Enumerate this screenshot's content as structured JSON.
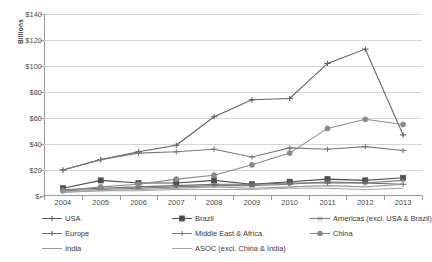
{
  "chart_data": {
    "type": "line",
    "title": "",
    "xlabel": "",
    "ylabel": "Billions",
    "y_axis_title": "Billions",
    "categories": [
      "2004",
      "2005",
      "2006",
      "2007",
      "2008",
      "2009",
      "2010",
      "2011",
      "2012",
      "2013"
    ],
    "x": [
      2004,
      2005,
      2006,
      2007,
      2008,
      2009,
      2010,
      2011,
      2012,
      2013
    ],
    "ylim": [
      0,
      140
    ],
    "ytick_labels": [
      "$-",
      "$20",
      "$40",
      "$60",
      "$80",
      "$100",
      "$120",
      "$140"
    ],
    "ytick_values": [
      0,
      20,
      40,
      60,
      80,
      100,
      120,
      140
    ],
    "grid": true,
    "legend_position": "bottom",
    "series": [
      {
        "name": "USA",
        "marker": "cross",
        "color": "#5f5f5f",
        "values": [
          20,
          28,
          34,
          39,
          61,
          74,
          75,
          102,
          113,
          47
        ]
      },
      {
        "name": "Brazil",
        "marker": "square",
        "color": "#4d4d4d",
        "values": [
          6,
          12,
          10,
          10,
          12,
          9,
          11,
          13,
          12,
          14
        ]
      },
      {
        "name": "Americas (excl. USA & Brazil)",
        "marker": "asterisk",
        "color": "#7a7a7a",
        "values": [
          4,
          5,
          6,
          7,
          8,
          8,
          9,
          11,
          10,
          12
        ]
      },
      {
        "name": "Europe",
        "marker": "plus",
        "color": "#6b6b6b",
        "values": [
          5,
          6,
          7,
          8,
          9,
          9,
          10,
          10,
          10,
          9
        ]
      },
      {
        "name": "Middle East & Africa",
        "marker": "plus",
        "color": "#7a7a7a",
        "values": [
          20,
          28,
          33,
          34,
          36,
          30,
          37,
          36,
          38,
          35
        ]
      },
      {
        "name": "China",
        "marker": "circle",
        "color": "#8a8a8a",
        "values": [
          4,
          7,
          9,
          13,
          16,
          24,
          33,
          52,
          59,
          55
        ]
      },
      {
        "name": "India",
        "marker": "none",
        "color": "#9a9a9a",
        "values": [
          3,
          4,
          5,
          6,
          7,
          6,
          7,
          8,
          7,
          9
        ]
      },
      {
        "name": "ASOC (excl. China & India)",
        "marker": "none",
        "color": "#a5a5a5",
        "values": [
          3,
          4,
          4,
          5,
          5,
          5,
          6,
          6,
          5,
          6
        ]
      }
    ]
  },
  "legend": {
    "items": [
      {
        "label": "USA"
      },
      {
        "label": "Brazil"
      },
      {
        "label": "Americas (excl. USA & Brazil)"
      },
      {
        "label": "Europe"
      },
      {
        "label": "Middle East & Africa"
      },
      {
        "label": "China"
      },
      {
        "label": "India"
      },
      {
        "label": "ASOC (excl. China & India)"
      }
    ]
  }
}
